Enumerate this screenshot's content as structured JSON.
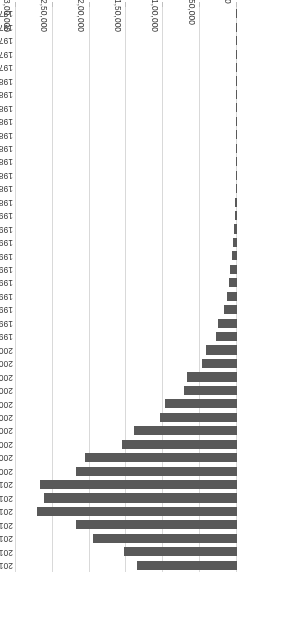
{
  "chart_data": {
    "type": "bar",
    "orientation": "horizontal",
    "title": "",
    "subtitle": "",
    "xlabel": "",
    "ylabel": "",
    "xlim": [
      0,
      300000
    ],
    "grid": true,
    "legend": false,
    "rotated_180": true,
    "bar_color": "#595959",
    "gridline_color": "#d9d9d9",
    "axis_text_color": "#404040",
    "xticks": [
      0,
      50000,
      100000,
      150000,
      200000,
      250000,
      300000
    ],
    "xtick_labels": [
      "0",
      "50,000",
      "1,00,000",
      "1,50,000",
      "2,00,000",
      "2,50,000",
      "3,00,000"
    ],
    "categories": [
      "2016",
      "2015",
      "2014",
      "2013",
      "2012",
      "2011",
      "2010",
      "2009",
      "2008",
      "2007",
      "2006",
      "2005",
      "2004",
      "2003",
      "2002",
      "2001",
      "2000",
      "1999",
      "1998",
      "1997",
      "1996",
      "1995",
      "1994",
      "1993",
      "1992",
      "1991",
      "1990",
      "1989",
      "1988",
      "1987",
      "1986",
      "1985",
      "1984",
      "1983",
      "1982",
      "1981",
      "1980",
      "1979",
      "1978",
      "1977",
      "1976",
      "1975"
    ],
    "values": [
      136000,
      154000,
      196000,
      218000,
      272000,
      262000,
      268000,
      218000,
      206000,
      156000,
      140000,
      104000,
      98000,
      72000,
      68000,
      48000,
      42000,
      28000,
      26000,
      17000,
      14000,
      10500,
      9000,
      7200,
      5000,
      3800,
      3000,
      2200,
      1800,
      1500,
      1200,
      1000,
      800,
      650,
      520,
      400,
      300,
      250,
      200,
      160,
      120,
      90
    ]
  }
}
